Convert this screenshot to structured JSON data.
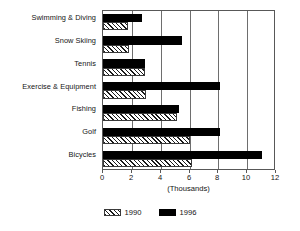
{
  "chart_data": {
    "type": "bar",
    "orientation": "horizontal",
    "title": "",
    "xlabel": "(Thousands)",
    "ylabel": "",
    "xlim": [
      0,
      12
    ],
    "xticks": [
      0,
      2,
      4,
      6,
      8,
      10,
      12
    ],
    "xtick_labels": [
      "0",
      "2",
      "4",
      "6",
      "8",
      "10",
      "12"
    ],
    "grid": true,
    "grid_axis": "x",
    "legend_position": "bottom-center",
    "categories": [
      "Swimming & Diving",
      "Snow Skiing",
      "Tennis",
      "Exercise & Equipment",
      "Fishing",
      "Golf",
      "Bicycles"
    ],
    "series": [
      {
        "name": "1990",
        "style": "hatched",
        "color": "#ffffff",
        "values": [
          1.7,
          1.8,
          2.9,
          3.0,
          5.1,
          6.0,
          6.2
        ]
      },
      {
        "name": "1996",
        "style": "solid",
        "color": "#000000",
        "values": [
          2.7,
          5.5,
          2.9,
          8.1,
          5.3,
          8.1,
          11.0
        ]
      }
    ]
  },
  "legend": {
    "items": [
      {
        "label": "1990",
        "swatch": "hatch-swatch-icon"
      },
      {
        "label": "1996",
        "swatch": "solid-swatch-icon"
      }
    ]
  }
}
